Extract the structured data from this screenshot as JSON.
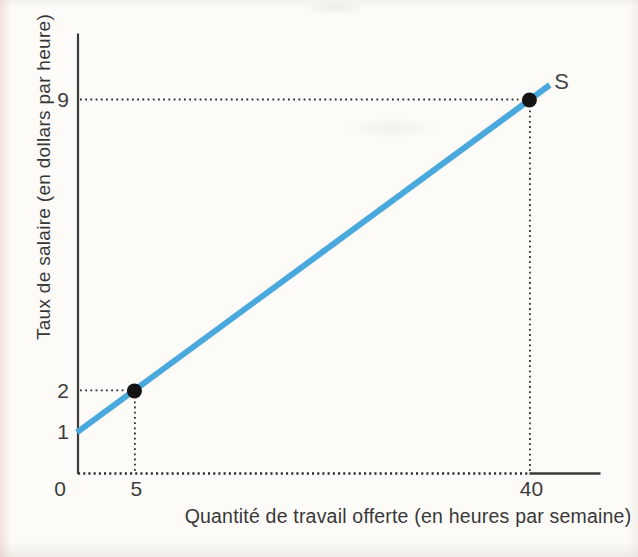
{
  "figure": {
    "background": "#fcfbf8"
  },
  "chart_data": {
    "type": "line",
    "title": "",
    "xlabel": "Quantité de travail offerte (en heures par semaine)",
    "ylabel": "Taux de salaire (en dollars par heure)",
    "series": [
      {
        "name": "S",
        "points": [
          {
            "x": 5,
            "y": 2
          },
          {
            "x": 40,
            "y": 9
          }
        ],
        "slope": 0.2,
        "y_intercept": 1,
        "x_draw_range": [
          0,
          41.8
        ],
        "color": "#49a8dc"
      }
    ],
    "x_ticks": [
      0,
      5,
      40
    ],
    "y_ticks": [
      1,
      2,
      9
    ],
    "xlim": [
      0,
      46.3
    ],
    "ylim": [
      0,
      10.6
    ],
    "grid": false,
    "legend_position": "none",
    "dashed_projections": [
      {
        "x": 5,
        "y": 2
      },
      {
        "x": 40,
        "y": 9
      }
    ],
    "axis_style": {
      "x_axis_dotted_until_x": 40
    }
  },
  "colors": {
    "line": "#49a8dc",
    "axis": "#3a3a3a",
    "dash": "#2e2e2e",
    "point": "#141414",
    "text": "#3d3d3d"
  }
}
